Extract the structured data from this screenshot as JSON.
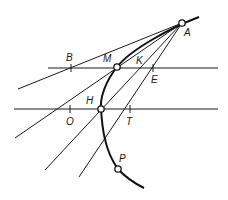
{
  "diagram": {
    "colors": {
      "ink": "#1a1a1a",
      "background": "#ffffff"
    },
    "labels": {
      "A": "A",
      "B": "B",
      "M": "M",
      "K": "K",
      "E": "E",
      "H": "H",
      "O": "O",
      "T": "T",
      "P": "P"
    },
    "points_marked": [
      "A",
      "M",
      "H",
      "P"
    ],
    "ticks": [
      "B",
      "E",
      "O",
      "T"
    ]
  }
}
